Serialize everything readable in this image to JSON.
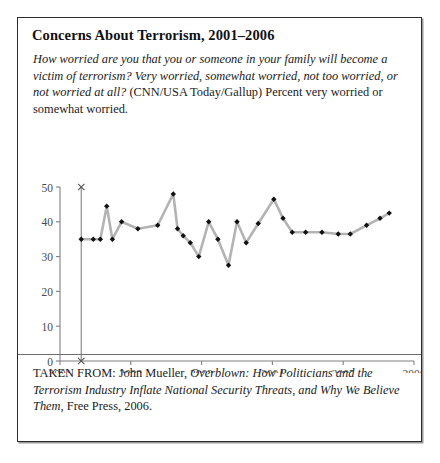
{
  "figure": {
    "title": "Concerns About Terrorism, 2001–2006",
    "question_part1": "How worried are you that you or someone in your family will become a victim of terrorism? Very worried, somewhat worried, not too worried, or not worried at all? ",
    "question_part2": "(CNN/USA Today/Gallup) Percent very worried or somewhat worried.",
    "caption_prefix": "TAKEN FROM: John Mueller, ",
    "caption_title": "Overblown: How Politicians and the Terrorism Industry Inflate National Security Threats, and Why We Believe Them",
    "caption_suffix": ", Free Press, 2006."
  },
  "colors": {
    "line": "#b3b3b3",
    "marker": "#111111",
    "axis": "#808080",
    "tick_text": "#4a4a4a",
    "border": "#2b2b2b",
    "background": "#ffffff"
  },
  "chart_data": {
    "type": "line",
    "title": "Concerns About Terrorism, 2001–2006",
    "xlabel": "",
    "ylabel": "",
    "xlim": [
      2001,
      2006
    ],
    "ylim": [
      0,
      50
    ],
    "ytick_values": [
      0,
      10,
      20,
      30,
      40,
      50
    ],
    "ytick_labels": [
      "0",
      "10",
      "20",
      "30",
      "40",
      "50"
    ],
    "xtick_values": [
      2001,
      2002,
      2003,
      2004,
      2005,
      2006
    ],
    "xtick_labels": [
      "2001",
      "2002",
      "2003",
      "2004",
      "2005",
      "2006"
    ],
    "grid": false,
    "legend": "none",
    "marker": "diamond",
    "series": [
      {
        "name": "Percent very or somewhat worried",
        "x": [
          2001.3,
          2001.47,
          2001.57,
          2001.66,
          2001.74,
          2001.87,
          2002.1,
          2002.38,
          2002.6,
          2002.66,
          2002.74,
          2002.84,
          2002.96,
          2003.1,
          2003.23,
          2003.38,
          2003.5,
          2003.63,
          2003.8,
          2004.02,
          2004.15,
          2004.28,
          2004.47,
          2004.7,
          2004.93,
          2005.1,
          2005.33,
          2005.52,
          2005.65
        ],
        "values": [
          35,
          35,
          35,
          44.5,
          35,
          40,
          38,
          39,
          48,
          38,
          36,
          34,
          30,
          40,
          35,
          27.5,
          40,
          34,
          39.5,
          46.5,
          41,
          37,
          37,
          37,
          36.5,
          36.5,
          39,
          41,
          42.5
        ]
      }
    ]
  }
}
